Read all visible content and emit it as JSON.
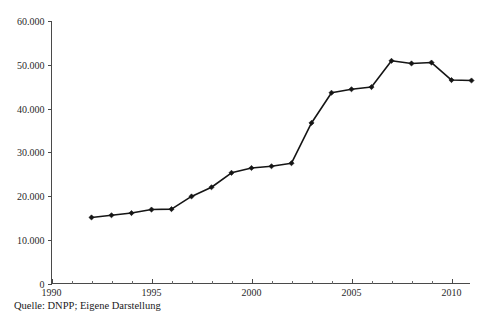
{
  "chart_data": {
    "type": "line",
    "title": "",
    "subtitle": "",
    "xlabel": "",
    "ylabel": "",
    "x": [
      1992,
      1993,
      1994,
      1995,
      1996,
      1997,
      1998,
      1999,
      2000,
      2001,
      2002,
      2003,
      2004,
      2005,
      2006,
      2007,
      2008,
      2009,
      2010,
      2011
    ],
    "values": [
      15100,
      15600,
      16100,
      16900,
      17000,
      19900,
      22000,
      25300,
      26400,
      26800,
      27500,
      36700,
      43600,
      44400,
      44900,
      50900,
      50300,
      50500,
      46500,
      46400
    ],
    "series": [
      {
        "name": "",
        "values": [
          15100,
          15600,
          16100,
          16900,
          17000,
          19900,
          22000,
          25300,
          26400,
          26800,
          27500,
          36700,
          43600,
          44400,
          44900,
          50900,
          50300,
          50500,
          46500,
          46400
        ]
      }
    ],
    "xlim": [
      1990,
      2011.5
    ],
    "ylim": [
      0,
      60000
    ],
    "grid": false,
    "legend": null,
    "marker": "diamond",
    "line_color": "#151515",
    "y_ticks": [
      0,
      10000,
      20000,
      30000,
      40000,
      50000,
      60000
    ],
    "y_tick_labels": [
      "0",
      "10.000",
      "20.000",
      "30.000",
      "40.000",
      "50.000",
      "60.000"
    ],
    "x_ticks": [
      1990,
      1995,
      2000,
      2005,
      2010
    ],
    "x_tick_labels": [
      "1990",
      "1995",
      "2000",
      "2005",
      "2010"
    ],
    "x_minor_tick_step": 1,
    "annotations": []
  },
  "caption": {
    "source_text": "Quelle: DNPP; Eigene Darstellung"
  },
  "colors": {
    "axis": "#4a4a4a",
    "line": "#151515",
    "marker": "#151515",
    "text": "#1a1a1a",
    "background": "#ffffff"
  }
}
